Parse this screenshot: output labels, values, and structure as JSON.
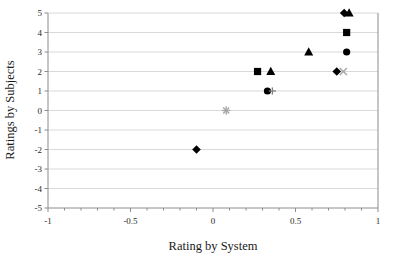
{
  "chart_data": {
    "type": "scatter",
    "title": "",
    "xlabel": "Rating by System",
    "ylabel": "Ratings by Subjects",
    "xlim": [
      -1,
      1
    ],
    "ylim": [
      -5,
      5
    ],
    "xticks": [
      -1,
      -0.5,
      0,
      0.5,
      1
    ],
    "xtick_labels": [
      "-1",
      "-0.5",
      "0",
      "0.5",
      "1"
    ],
    "yticks": [
      -5,
      -4,
      -3,
      -2,
      -1,
      0,
      1,
      2,
      3,
      4,
      5
    ],
    "ytick_labels": [
      "-5",
      "-4",
      "-3",
      "-2",
      "-1",
      "0",
      "1",
      "2",
      "3",
      "4",
      "5"
    ],
    "grid": "horizontal",
    "grid_color": "#d9d9d9",
    "axis_color": "#8c8c8c",
    "legend": "none",
    "marker_color_filled": "#000000",
    "marker_color_open": "#a6a6a6",
    "points": [
      {
        "x": -0.1,
        "y": -2,
        "marker": "diamond",
        "color": "#000000"
      },
      {
        "x": 0.08,
        "y": 0,
        "marker": "asterisk",
        "color": "#a6a6a6"
      },
      {
        "x": 0.27,
        "y": 2,
        "marker": "square",
        "color": "#000000"
      },
      {
        "x": 0.33,
        "y": 1,
        "marker": "circle",
        "color": "#000000"
      },
      {
        "x": 0.36,
        "y": 1,
        "marker": "plus",
        "color": "#808080"
      },
      {
        "x": 0.35,
        "y": 2,
        "marker": "triangle",
        "color": "#000000"
      },
      {
        "x": 0.58,
        "y": 3,
        "marker": "triangle",
        "color": "#000000"
      },
      {
        "x": 0.75,
        "y": 2,
        "marker": "diamond",
        "color": "#000000"
      },
      {
        "x": 0.79,
        "y": 2,
        "marker": "cross",
        "color": "#a6a6a6"
      },
      {
        "x": 0.81,
        "y": 3,
        "marker": "circle",
        "color": "#000000"
      },
      {
        "x": 0.81,
        "y": 4,
        "marker": "square",
        "color": "#000000"
      },
      {
        "x": 0.795,
        "y": 5,
        "marker": "diamond",
        "color": "#000000"
      },
      {
        "x": 0.825,
        "y": 5,
        "marker": "triangle",
        "color": "#000000"
      }
    ]
  }
}
